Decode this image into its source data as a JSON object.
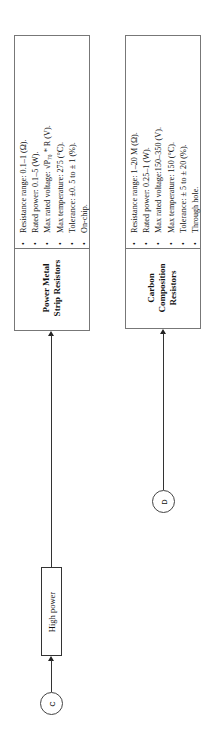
{
  "diagram": {
    "orientation": "rotated -90deg",
    "nodes": [
      {
        "id": "power-metal-strip",
        "title": "Power Metal Strip Resistors",
        "title_lines": [
          "Power Metal",
          "Strip Resistors"
        ],
        "specs": [
          "Resistance range: 0.1–1 (Ω).",
          "Rated power: 0.1–5 (W).",
          "Max rated voltage: √P₇₀ * R (V).",
          "Max temperature: 275 (°C).",
          "Tolerance: ±0. 5 to ± 1 (%).",
          "On-chip."
        ]
      },
      {
        "id": "carbon-composition",
        "title": "Carbon Composition Resistors",
        "title_lines": [
          "Carbon",
          "Composition",
          "Resistors"
        ],
        "specs": [
          "Resistance range: 1–20 M (Ω).",
          "Rated power: 0.25–1 (W).",
          "Max rated voltage:150–350 (V).",
          "Max temperature: 150 (°C).",
          "Tolerance: ± 5 to ± 20 (%).",
          "Through hole."
        ]
      }
    ],
    "category_box": {
      "label": "High power"
    },
    "connectors": [
      {
        "label": "C"
      },
      {
        "label": "D"
      }
    ],
    "bullet": "•"
  }
}
